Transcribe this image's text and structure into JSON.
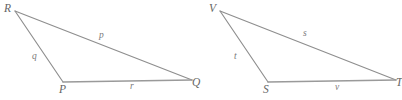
{
  "figure": {
    "type": "geometry-diagram",
    "stroke_color": "#8e8e8e",
    "label_color": "#6f6f6f",
    "background_color": "#ffffff",
    "triangles": [
      {
        "name": "triangle-pqr",
        "vertices": [
          {
            "label": "R",
            "x": 15,
            "y": 11
          },
          {
            "label": "P",
            "x": 63,
            "y": 82
          },
          {
            "label": "Q",
            "x": 192,
            "y": 80
          }
        ],
        "vertex_labels": [
          {
            "text": "R",
            "x": 4,
            "y": 3
          },
          {
            "text": "P",
            "x": 59,
            "y": 84
          },
          {
            "text": "Q",
            "x": 192,
            "y": 77
          }
        ],
        "sides": [
          {
            "text": "p",
            "from": "R",
            "to": "Q",
            "x": 99,
            "y": 31
          },
          {
            "text": "q",
            "from": "R",
            "to": "P",
            "x": 32,
            "y": 52
          },
          {
            "text": "r",
            "from": "P",
            "to": "Q",
            "x": 130,
            "y": 82
          }
        ]
      },
      {
        "name": "triangle-stv",
        "vertices": [
          {
            "label": "V",
            "x": 220,
            "y": 11
          },
          {
            "label": "S",
            "x": 268,
            "y": 82
          },
          {
            "label": "T",
            "x": 396,
            "y": 80
          }
        ],
        "vertex_labels": [
          {
            "text": "V",
            "x": 209,
            "y": 3
          },
          {
            "text": "S",
            "x": 263,
            "y": 84
          },
          {
            "text": "T",
            "x": 396,
            "y": 77
          }
        ],
        "sides": [
          {
            "text": "s",
            "from": "V",
            "to": "T",
            "x": 303,
            "y": 29
          },
          {
            "text": "t",
            "from": "V",
            "to": "S",
            "x": 234,
            "y": 52
          },
          {
            "text": "v",
            "from": "S",
            "to": "T",
            "x": 335,
            "y": 83
          }
        ]
      }
    ]
  }
}
